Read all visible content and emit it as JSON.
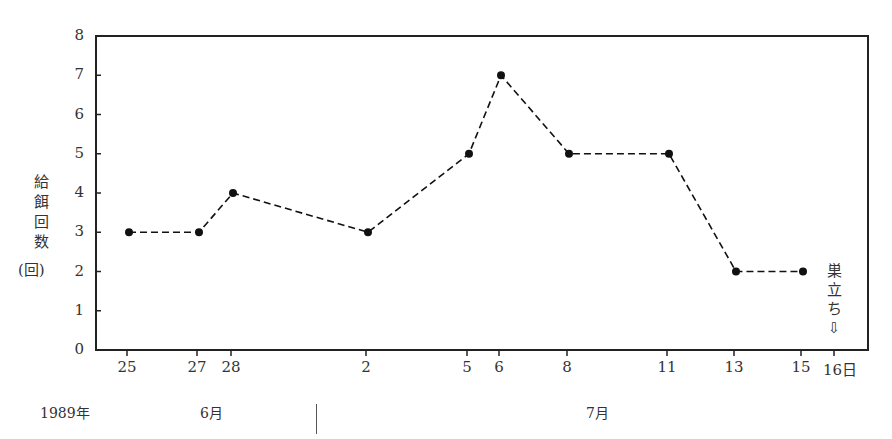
{
  "chart_data": {
    "type": "line",
    "title": "",
    "xlabel": "",
    "ylabel": "給餌回数 (回)",
    "ylim": [
      0,
      8
    ],
    "yticks": [
      "0",
      "1",
      "2",
      "3",
      "4",
      "5",
      "6",
      "7",
      "8"
    ],
    "grid": false,
    "legend": null,
    "line_style": "dashed",
    "marker": "filled-circle",
    "year_label": "1989年",
    "months": [
      {
        "label": "6月",
        "days": [
          "25",
          "27",
          "28"
        ]
      },
      {
        "label": "7月",
        "days": [
          "2",
          "5",
          "6",
          "8",
          "11",
          "13",
          "15",
          "16"
        ]
      }
    ],
    "categories": [
      "6/25",
      "6/27",
      "6/28",
      "7/2",
      "7/5",
      "7/6",
      "7/8",
      "7/11",
      "7/13",
      "7/15",
      "7/16"
    ],
    "x_tick_labels": [
      "25",
      "27",
      "28",
      "2",
      "5",
      "6",
      "8",
      "11",
      "13",
      "15",
      "16日"
    ],
    "series": [
      {
        "name": "給餌回数",
        "x": [
          "6/25",
          "6/27",
          "6/28",
          "7/2",
          "7/5",
          "7/6",
          "7/8",
          "7/11",
          "7/13",
          "7/15"
        ],
        "values": [
          3,
          3,
          4,
          3,
          5,
          7,
          5,
          5,
          2,
          2
        ]
      }
    ],
    "annotations": [
      {
        "text": "巣立ち",
        "arrow": "⇩",
        "at": "7/16"
      }
    ]
  },
  "axis": {
    "ylabel_chars": [
      "給",
      "餌",
      "回",
      "数"
    ],
    "yunit": "(回)",
    "year": "1989年",
    "month_june": "6月",
    "month_july": "7月",
    "fledge_chars": [
      "巣",
      "立",
      "ち"
    ],
    "fledge_arrow": "⇩"
  }
}
